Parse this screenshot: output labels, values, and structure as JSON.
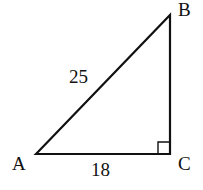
{
  "figure": {
    "shape": "right triangle",
    "vertices": {
      "A": "A",
      "B": "B",
      "C": "C"
    },
    "right_angle_at": "C",
    "sides": {
      "AB": "25",
      "AC": "18"
    }
  }
}
